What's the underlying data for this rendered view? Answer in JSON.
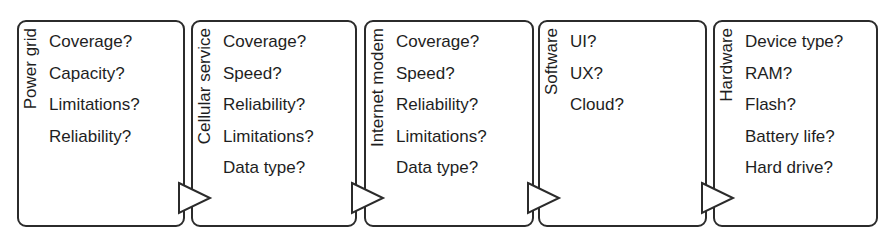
{
  "diagram": {
    "type": "flow",
    "direction": "left-to-right",
    "stages": [
      {
        "label": "Power grid",
        "questions": [
          "Coverage?",
          "Capacity?",
          "Limitations?",
          "Reliability?"
        ]
      },
      {
        "label": "Cellular service",
        "questions": [
          "Coverage?",
          "Speed?",
          "Reliability?",
          "Limitations?",
          "Data type?"
        ]
      },
      {
        "label": "Internet modem",
        "questions": [
          "Coverage?",
          "Speed?",
          "Reliability?",
          "Limitations?",
          "Data type?"
        ]
      },
      {
        "label": "Software",
        "questions": [
          "UI?",
          "UX?",
          "Cloud?"
        ]
      },
      {
        "label": "Hardware",
        "questions": [
          "Device type?",
          "RAM?",
          "Flash?",
          "Battery life?",
          "Hard drive?"
        ]
      }
    ],
    "connectors": [
      {
        "from": "Power grid",
        "to": "Cellular service",
        "shape": "triangle-arrow"
      },
      {
        "from": "Cellular service",
        "to": "Internet modem",
        "shape": "triangle-arrow"
      },
      {
        "from": "Internet modem",
        "to": "Software",
        "shape": "triangle-arrow"
      },
      {
        "from": "Software",
        "to": "Hardware",
        "shape": "triangle-arrow"
      }
    ],
    "colors": {
      "stroke": "#2b2b2b",
      "text": "#1e1e1e",
      "background": "#ffffff"
    }
  }
}
